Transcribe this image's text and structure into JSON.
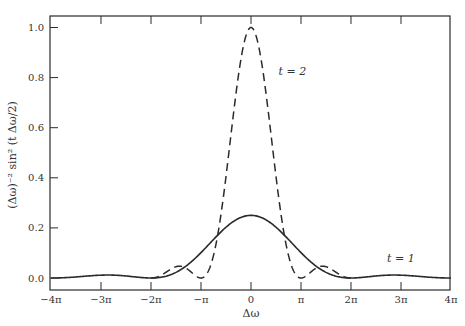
{
  "chart_data": {
    "type": "line",
    "title": "",
    "xlabel": "Δω",
    "ylabel": "(Δω)⁻² sin² (t Δω/2)",
    "xlim": [
      -12.566,
      12.566
    ],
    "ylim": [
      -0.05,
      1.05
    ],
    "grid": false,
    "x_ticks": [
      {
        "value": -12.566,
        "label": "−4π"
      },
      {
        "value": -9.425,
        "label": "−3π"
      },
      {
        "value": -6.283,
        "label": "−2π"
      },
      {
        "value": -3.142,
        "label": "−π"
      },
      {
        "value": 0,
        "label": "0"
      },
      {
        "value": 3.142,
        "label": "π"
      },
      {
        "value": 6.283,
        "label": "2π"
      },
      {
        "value": 9.425,
        "label": "3π"
      },
      {
        "value": 12.566,
        "label": "4π"
      }
    ],
    "y_ticks": [
      {
        "value": 0.0,
        "label": "0.0"
      },
      {
        "value": 0.2,
        "label": "0.2"
      },
      {
        "value": 0.4,
        "label": "0.4"
      },
      {
        "value": 0.6,
        "label": "0.6"
      },
      {
        "value": 0.8,
        "label": "0.8"
      },
      {
        "value": 1.0,
        "label": "1.0"
      }
    ],
    "series": [
      {
        "name": "t = 1",
        "t": 1,
        "style": "solid",
        "x_range": [
          -12.566,
          12.566
        ],
        "peak": 0.25,
        "zeros": [
          "±2π",
          "±4π"
        ],
        "label_position": {
          "x_units_pi": 3.0,
          "y": 0.065
        }
      },
      {
        "name": "t = 2",
        "t": 2,
        "style": "dashed",
        "x_range": [
          -6.283,
          6.283
        ],
        "peak": 1.0,
        "zeros": [
          "±π",
          "±2π"
        ],
        "label_position": {
          "x_units_pi": 0.55,
          "y": 0.81
        }
      }
    ],
    "legend_position": "inline labels"
  }
}
